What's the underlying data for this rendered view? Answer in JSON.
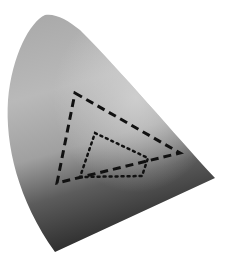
{
  "diagram": {
    "type": "chromaticity-gamut-diagram",
    "colors": {
      "background": "#ffffff",
      "region_light": "#c4c4c4",
      "region_mid": "#9a9a9a",
      "region_dark": "#3a3a3a",
      "outline": "#111111"
    },
    "locus_path": "M45,15 C30,22 12,55 8,100 C5,145 18,200 55,252 L215,178 C175,135 120,70 80,30 C68,20 55,13 45,15 Z",
    "gamuts": [
      {
        "name": "gamut-dashed",
        "style": "dashed",
        "points": "75,93 180,153 57,183"
      },
      {
        "name": "gamut-dotted",
        "style": "dotted",
        "points": "95,133 148,158 142,176 80,177"
      }
    ]
  }
}
